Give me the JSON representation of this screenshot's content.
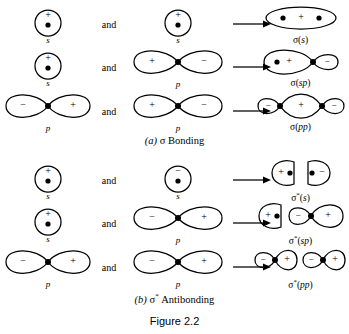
{
  "figure": {
    "number": "Figure 2.2",
    "panels": [
      {
        "caption_prefix": "(a)",
        "caption_text": "σ Bonding",
        "connector": "and",
        "rows": [
          {
            "left": {
              "type": "s",
              "label": "s",
              "sign": "+",
              "nucleus": true
            },
            "right": {
              "type": "s",
              "label": "s",
              "sign": "+",
              "nucleus": true
            },
            "product": {
              "shape": "ellipse-sigma-s",
              "label": "σ(s)",
              "signs": [
                "+"
              ]
            }
          },
          {
            "left": {
              "type": "s",
              "label": "s",
              "sign": "+",
              "nucleus": true
            },
            "right": {
              "type": "p",
              "label": "p",
              "signs": [
                "+",
                "−"
              ]
            },
            "product": {
              "shape": "sigma-sp",
              "label": "σ(sp)",
              "signs": [
                "+",
                "−"
              ]
            }
          },
          {
            "left": {
              "type": "p",
              "label": "p",
              "signs": [
                "−",
                "+"
              ]
            },
            "right": {
              "type": "p",
              "label": "p",
              "signs": [
                "+",
                "−"
              ]
            },
            "product": {
              "shape": "sigma-pp",
              "label": "σ(pp)",
              "signs": [
                "−",
                "+",
                "−"
              ]
            }
          }
        ]
      },
      {
        "caption_prefix": "(b)",
        "caption_text": "σ* Antibonding",
        "connector": "and",
        "rows": [
          {
            "left": {
              "type": "s",
              "label": "s",
              "sign": "+",
              "nucleus": true
            },
            "right": {
              "type": "s",
              "label": "s",
              "sign": "−",
              "nucleus": true
            },
            "product": {
              "shape": "antibond-s",
              "label": "σ*(s)",
              "signs": [
                "+",
                "−"
              ]
            }
          },
          {
            "left": {
              "type": "s",
              "label": "s",
              "sign": "+",
              "nucleus": true
            },
            "right": {
              "type": "p",
              "label": "p",
              "signs": [
                "−",
                "+"
              ]
            },
            "product": {
              "shape": "antibond-sp",
              "label": "σ*(sp)",
              "signs": [
                "+",
                "−",
                "+"
              ]
            }
          },
          {
            "left": {
              "type": "p",
              "label": "p",
              "signs": [
                "−",
                "+"
              ]
            },
            "right": {
              "type": "p",
              "label": "p",
              "signs": [
                "−",
                "+"
              ]
            },
            "product": {
              "shape": "antibond-pp",
              "label": "σ*(pp)",
              "signs": [
                "−",
                "+",
                "−",
                "+"
              ]
            }
          }
        ]
      }
    ]
  }
}
